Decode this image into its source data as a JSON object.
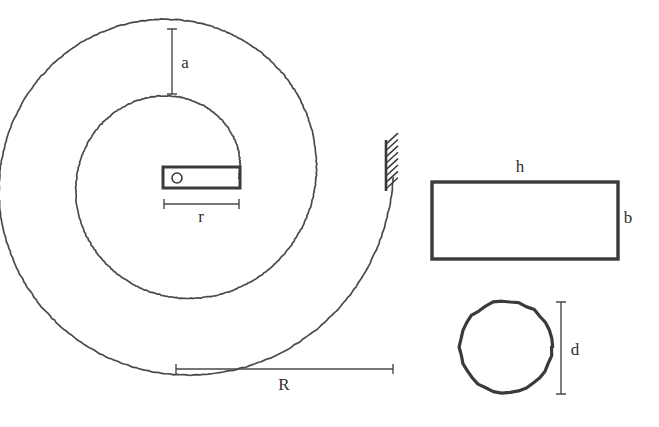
{
  "figure": {
    "background_color": "#ffffff",
    "line_color": "#4a4a4a",
    "heavy_line_color": "#3a3a3a",
    "label_color": "#2e2e2e"
  },
  "labels": {
    "a": "a",
    "r": "r",
    "R": "R",
    "h": "h",
    "b": "b",
    "d": "d"
  },
  "parts": {
    "spiral": {
      "name": "spiral-spring-coil",
      "center_x": 177,
      "center_y": 178,
      "turns": 2
    },
    "arbor": {
      "name": "arbor-pivot-circle",
      "cx": 177,
      "cy": 178,
      "radius": 5
    },
    "arbor_bar": {
      "name": "arbor-bar",
      "x": 163,
      "y": 167,
      "width": 77,
      "height": 21
    },
    "wall": {
      "name": "fixed-support-wall",
      "x": 386,
      "y_top": 140,
      "y_bottom": 191,
      "hatch_count": 8
    },
    "rectangle_section": {
      "name": "rectangular-cross-section",
      "x": 432,
      "y": 182,
      "width": 186,
      "height": 77
    },
    "circle_section": {
      "name": "circular-cross-section",
      "cx": 506,
      "cy": 347,
      "radius": 46
    }
  },
  "dimensions": {
    "a": {
      "orientation": "vertical",
      "x": 172,
      "y1": 29,
      "y2": 94,
      "label_x": 185,
      "label_y": 68
    },
    "r": {
      "orientation": "horizontal",
      "y": 204,
      "x1": 164,
      "x2": 239,
      "label_x": 201,
      "label_y": 222
    },
    "R": {
      "orientation": "horizontal",
      "y": 369,
      "x1": 176,
      "x2": 393,
      "label_x": 284,
      "label_y": 390
    },
    "d": {
      "orientation": "vertical",
      "x": 561,
      "y1": 302,
      "y2": 394,
      "label_x": 575,
      "label_y": 355
    },
    "h": {
      "orientation": "label-only",
      "label_x": 520,
      "label_y": 172
    },
    "b": {
      "orientation": "label-only",
      "label_x": 628,
      "label_y": 223
    }
  }
}
